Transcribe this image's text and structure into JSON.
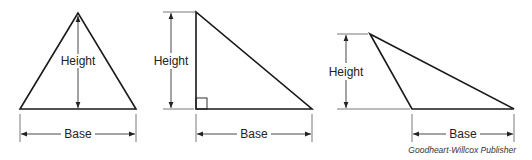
{
  "figure": {
    "type": "triangle-area-diagram",
    "triangles": [
      {
        "id": "acute",
        "height_label": "Height",
        "base_label": "Base"
      },
      {
        "id": "right",
        "height_label": "Height",
        "base_label": "Base"
      },
      {
        "id": "obtuse",
        "height_label": "Height",
        "base_label": "Base"
      }
    ],
    "credit": "Goodheart-Willcox Publisher",
    "colors": {
      "line": "#1a1a1a",
      "dimension": "#333333",
      "background": "#ffffff"
    }
  }
}
